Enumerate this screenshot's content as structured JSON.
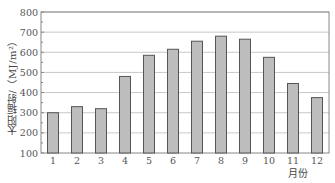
{
  "chart_data": {
    "type": "bar",
    "title": "",
    "xlabel": "月份",
    "ylabel": "太阳辐射/（MJ/m²）",
    "categories": [
      "1",
      "2",
      "3",
      "4",
      "5",
      "6",
      "7",
      "8",
      "9",
      "10",
      "11",
      "12"
    ],
    "values": [
      300,
      330,
      320,
      480,
      585,
      615,
      655,
      680,
      665,
      575,
      445,
      375
    ],
    "ylim": [
      100,
      800
    ],
    "yticks": [
      100,
      200,
      300,
      400,
      500,
      600,
      700,
      800
    ],
    "grid": true,
    "legend": null,
    "colors": {
      "bar_fill": "#bdbdbd",
      "bar_edge": "#555555",
      "grid": "#c8c8c8",
      "axis": "#888888"
    }
  }
}
